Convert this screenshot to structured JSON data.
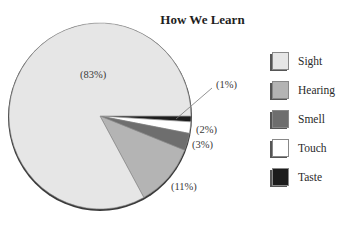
{
  "chart_data": {
    "type": "pie",
    "title": "How We Learn",
    "categories": [
      "Sight",
      "Hearing",
      "Smell",
      "Touch",
      "Taste"
    ],
    "values": [
      83,
      11,
      3,
      2,
      1
    ],
    "unit": "%",
    "labels": [
      "(83%)",
      "(11%)",
      "(3%)",
      "(2%)",
      "(1%)"
    ],
    "colors": [
      "#e6e6e6",
      "#b4b4b4",
      "#6e6e6e",
      "#ffffff",
      "#1c1c1c"
    ],
    "legend_position": "right",
    "start_angle_deg": 0,
    "direction": "clockwise"
  },
  "title": "How We Learn",
  "legend": [
    {
      "label": "Sight",
      "color": "#e6e6e6"
    },
    {
      "label": "Hearing",
      "color": "#b4b4b4"
    },
    {
      "label": "Smell",
      "color": "#6e6e6e"
    },
    {
      "label": "Touch",
      "color": "#ffffff"
    },
    {
      "label": "Taste",
      "color": "#1c1c1c"
    }
  ],
  "slice_labels": {
    "sight": "(83%)",
    "hearing": "(11%)",
    "smell": "(3%)",
    "touch": "(2%)",
    "taste": "(1%)"
  }
}
